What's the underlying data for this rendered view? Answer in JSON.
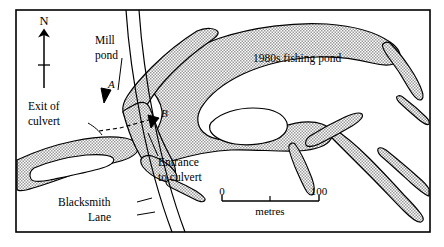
{
  "figure": {
    "type": "map",
    "border_color": "#000000",
    "water_fill_color": "#c9c9c9",
    "outline_color": "#000000",
    "background_color": "#ffffff"
  },
  "north_arrow": {
    "label": "N",
    "name": "north-arrow"
  },
  "labels": {
    "mill_pond": "Mill\npond",
    "mill_pond_line1": "Mill",
    "mill_pond_line2": "pond",
    "exit_of_culvert_line1": "Exit of",
    "exit_of_culvert_line2": "culvert",
    "entrance_to_culvert_line1": "Entrance",
    "entrance_to_culvert_line2": "to culvert",
    "blacksmith_lane_line1": "Blacksmith",
    "blacksmith_lane_line2": "Lane",
    "fishing_pond": "1980s fishing pond"
  },
  "points": [
    {
      "id": "A",
      "label": "A",
      "name": "point-marker-a"
    },
    {
      "id": "B",
      "label": "B",
      "name": "point-marker-b"
    }
  ],
  "scale_bar": {
    "min_label": "0",
    "max_label": "100",
    "units_label": "metres",
    "min_value": 0,
    "max_value": 100,
    "tick_count": 2
  }
}
